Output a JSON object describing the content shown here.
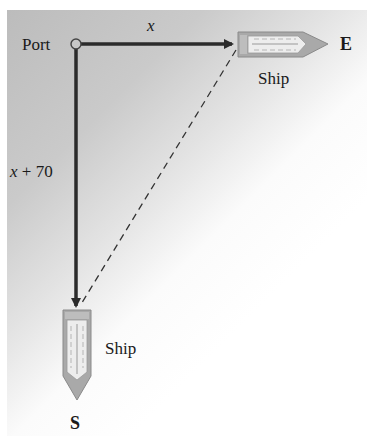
{
  "diagram": {
    "type": "navigation-right-triangle",
    "port_label": "Port",
    "east_leg_label": "x",
    "south_leg_label": "x + 70",
    "east_ship_label": "Ship",
    "south_ship_label": "Ship",
    "east_direction": "E",
    "south_direction": "S",
    "hypotenuse_style": "dashed",
    "colors": {
      "arrow": "#2b2b2b",
      "ship_hull": "#a8a8a8",
      "ship_deck": "#eeeeee",
      "background_start": "#bcbcbc",
      "background_end": "#ffffff"
    }
  }
}
